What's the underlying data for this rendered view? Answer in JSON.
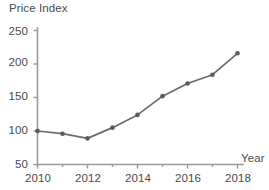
{
  "chart_data": {
    "type": "line",
    "title": "",
    "xlabel": "Year",
    "ylabel": "Price Index",
    "x": [
      2010,
      2011,
      2012,
      2013,
      2014,
      2015,
      2016,
      2017,
      2018
    ],
    "values": [
      100,
      96,
      89,
      105,
      124,
      152,
      171,
      184,
      216
    ],
    "series": [
      {
        "name": "Price Index",
        "values": [
          100,
          96,
          89,
          105,
          124,
          152,
          171,
          184,
          216
        ]
      }
    ],
    "xlim": [
      2010,
      2018
    ],
    "ylim": [
      50,
      250
    ],
    "ytick_labels": [
      "50",
      "100",
      "150",
      "200",
      "250"
    ],
    "yticks": [
      50,
      100,
      150,
      200,
      250
    ],
    "xtick_labels": [
      "2010",
      "2012",
      "2014",
      "2016",
      "2018"
    ],
    "xticks": [
      2010,
      2012,
      2014,
      2016,
      2018
    ],
    "xminor_ticks": [
      2011,
      2013,
      2015,
      2017
    ],
    "grid": false,
    "legend": "none",
    "marker": "circle",
    "line_color": "#6b6b6b",
    "marker_color": "#5a5a5a",
    "axis_color": "#9a9a9a",
    "text_color": "#4a4a4a",
    "background": "#ffffff"
  },
  "axes": {
    "y_title": "Price Index",
    "x_title": "Year"
  },
  "yticks": [
    {
      "label": "250"
    },
    {
      "label": "200"
    },
    {
      "label": "150"
    },
    {
      "label": "100"
    },
    {
      "label": "50"
    }
  ],
  "xticks": [
    {
      "label": "2010"
    },
    {
      "label": "2012"
    },
    {
      "label": "2014"
    },
    {
      "label": "2016"
    },
    {
      "label": "2018"
    }
  ]
}
